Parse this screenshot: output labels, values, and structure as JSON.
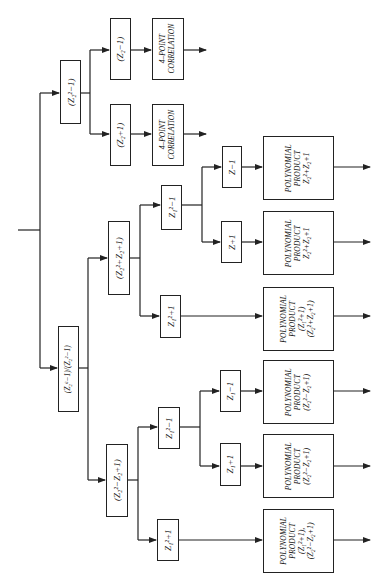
{
  "diagram": {
    "type": "decomposition-tree",
    "orientation": "rotated-90-ccw",
    "root": {
      "input_stub": true,
      "branches": [
        "node_a",
        "node_b"
      ]
    },
    "nodes": {
      "node_a": {
        "label": "(Z₂²−1)"
      },
      "node_b": {
        "label": "(Z₂⁶−1)/(Z₂²−1)"
      },
      "node_a1": {
        "label": "(Z₂−1)"
      },
      "node_a2": {
        "label": "(Z₂+1)"
      },
      "corr_1": {
        "line1": "4–POINT",
        "line2": "CORRELATION"
      },
      "corr_2": {
        "line1": "4–POINT",
        "line2": "CORRELATION"
      },
      "node_c": {
        "label": "(Z₂²+Z₂+1)"
      },
      "node_d": {
        "label": "(Z₂²−Z₂+1)"
      },
      "node_c1": {
        "label": "Z₁²−1"
      },
      "node_c2": {
        "label": "Z₁²+1"
      },
      "node_d1": {
        "label": "Z₁²−1"
      },
      "node_d2": {
        "label": "Z₁²+1"
      },
      "node_c1a": {
        "label": "Z−1"
      },
      "node_c1b": {
        "label": "Z+1"
      },
      "node_d1a": {
        "label": "Z₁−1"
      },
      "node_d1b": {
        "label": "Z₁+1"
      }
    },
    "poly_products": [
      {
        "line1": "POLYNOMIAL",
        "line2": "PRODUCT",
        "line3": "Z₂²+Z₂+1",
        "line4": ""
      },
      {
        "line1": "POLYNOMIAL",
        "line2": "PRODUCT",
        "line3": "Z₂²+Z₂+1",
        "line4": ""
      },
      {
        "line1": "POLYNOMIAL",
        "line2": "PRODUCT",
        "line3": "(Z₁²+1)",
        "line4": "(Z₂²+Z₂+1)"
      },
      {
        "line1": "POLYNOMIAL",
        "line2": "PRODUCT",
        "line3": "(Z₂²−Z₂+1)",
        "line4": ""
      },
      {
        "line1": "POLYNOMIAL",
        "line2": "PRODUCT",
        "line3": "(Z₂²−Z₂+1)",
        "line4": ""
      },
      {
        "line1": "POLYNOMIAL",
        "line2": "PRODUCT",
        "line3": "(Z₁²+1),",
        "line4": "(Z₂²−Z₂+1)"
      }
    ],
    "colors": {
      "line": "#222222",
      "background": "#ffffff",
      "text": "#111111"
    }
  }
}
